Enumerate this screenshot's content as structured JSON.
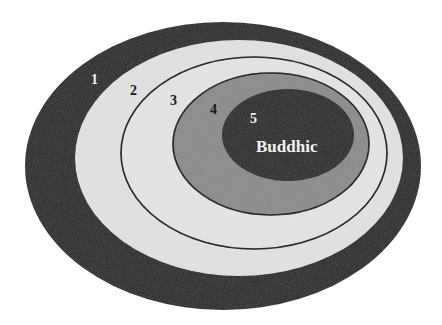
{
  "diagram": {
    "type": "nested-ellipses",
    "colors": {
      "background": "#ffffff",
      "ring1": "#2b2b2b",
      "ring2": "#e2e2e2",
      "ring3": "#e4e4e4",
      "ring4": "#8c8c8c",
      "ring5": "#2a2a2a",
      "outline": "#111111",
      "label_dark": "#1a1a1a",
      "label_light": "#f2f2f2"
    },
    "levels": [
      {
        "number": "1",
        "name": ""
      },
      {
        "number": "2",
        "name": ""
      },
      {
        "number": "3",
        "name": ""
      },
      {
        "number": "4",
        "name": ""
      },
      {
        "number": "5",
        "name": "Buddhic"
      }
    ]
  }
}
